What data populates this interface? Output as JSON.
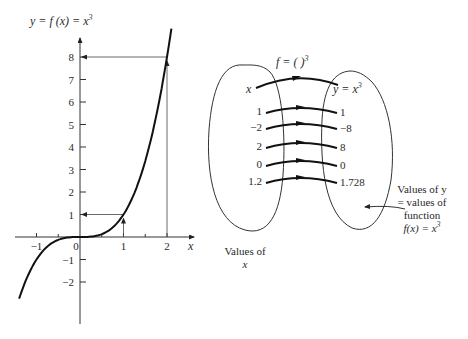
{
  "graph": {
    "y_axis_label": "y = f (x) = x",
    "y_axis_label_exp": "3",
    "x_axis_label": "x",
    "x_ticks": [
      {
        "value": -1,
        "label": "−1"
      },
      {
        "value": 0,
        "label": "0"
      },
      {
        "value": 1,
        "label": "1"
      },
      {
        "value": 2,
        "label": "2"
      }
    ],
    "y_ticks": [
      {
        "value": 8,
        "label": "8"
      },
      {
        "value": 7,
        "label": "7"
      },
      {
        "value": 6,
        "label": "6"
      },
      {
        "value": 5,
        "label": "5"
      },
      {
        "value": 4,
        "label": "4"
      },
      {
        "value": 3,
        "label": "3"
      },
      {
        "value": 2,
        "label": "2"
      },
      {
        "value": 1,
        "label": "1"
      },
      {
        "value": -1,
        "label": "−1"
      },
      {
        "value": -2,
        "label": "−2"
      }
    ],
    "minor_x_ticks": [
      -0.5,
      0.5,
      1.5
    ],
    "function": "x^3",
    "x_range": [
      -1.4,
      2.1
    ],
    "guides": [
      {
        "x": 1,
        "y": 1
      },
      {
        "x": 2,
        "y": 8
      }
    ]
  },
  "mapping": {
    "function_label": "f = (  )",
    "function_label_exp": "3",
    "domain_header": "x",
    "codomain_header": "y = x",
    "codomain_header_exp": "3",
    "pairs": [
      {
        "input": "1",
        "output": "1"
      },
      {
        "input": "−2",
        "output": "−8"
      },
      {
        "input": "2",
        "output": "8"
      },
      {
        "input": "0",
        "output": "0"
      },
      {
        "input": "1.2",
        "output": "1.728"
      }
    ],
    "domain_caption_line1": "Values of",
    "domain_caption_line2": "x",
    "codomain_caption_line1": "Values of y",
    "codomain_caption_line2": "= values of",
    "codomain_caption_line3": "function",
    "codomain_caption_line4": "f(x) = x",
    "codomain_caption_exp": "3"
  }
}
